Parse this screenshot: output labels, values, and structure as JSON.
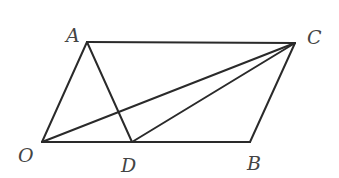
{
  "diagram": {
    "type": "geometry",
    "colors": {
      "line": "#2a2a2a",
      "label": "#444444",
      "background": "#ffffff"
    },
    "points": {
      "A": {
        "label": "A",
        "x": 87,
        "y": 42,
        "lx": 66,
        "ly": 42
      },
      "C": {
        "label": "C",
        "x": 295,
        "y": 43,
        "lx": 307,
        "ly": 44
      },
      "O": {
        "label": "O",
        "x": 42,
        "y": 142,
        "lx": 18,
        "ly": 162
      },
      "D": {
        "label": "D",
        "x": 132,
        "y": 142,
        "lx": 121,
        "ly": 172
      },
      "B": {
        "label": "B",
        "x": 250,
        "y": 142,
        "lx": 247,
        "ly": 170
      }
    },
    "segments": [
      {
        "name": "OA",
        "from": "O",
        "to": "A"
      },
      {
        "name": "AC",
        "from": "A",
        "to": "C"
      },
      {
        "name": "CB",
        "from": "C",
        "to": "B"
      },
      {
        "name": "OB",
        "from": "O",
        "to": "B"
      },
      {
        "name": "AD",
        "from": "A",
        "to": "D"
      },
      {
        "name": "OC",
        "from": "O",
        "to": "C"
      },
      {
        "name": "DC",
        "from": "D",
        "to": "C"
      }
    ]
  }
}
